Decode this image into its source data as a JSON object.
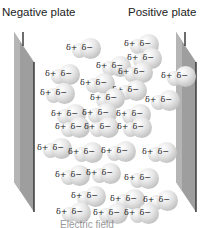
{
  "labels": {
    "negative_plate": "Negative plate",
    "positive_plate": "Positive plate",
    "caption_fragment": "Electric field"
  },
  "molecule_label": {
    "positive": "δ+",
    "negative": "δ−"
  },
  "molecules": [
    {
      "x": 66,
      "y": 38
    },
    {
      "x": 124,
      "y": 34
    },
    {
      "x": 127,
      "y": 48
    },
    {
      "x": 96,
      "y": 56
    },
    {
      "x": 45,
      "y": 64
    },
    {
      "x": 118,
      "y": 62
    },
    {
      "x": 161,
      "y": 66
    },
    {
      "x": 80,
      "y": 73
    },
    {
      "x": 112,
      "y": 80
    },
    {
      "x": 40,
      "y": 83
    },
    {
      "x": 90,
      "y": 88
    },
    {
      "x": 145,
      "y": 90
    },
    {
      "x": 51,
      "y": 104
    },
    {
      "x": 82,
      "y": 103
    },
    {
      "x": 116,
      "y": 104
    },
    {
      "x": 55,
      "y": 117
    },
    {
      "x": 84,
      "y": 117
    },
    {
      "x": 117,
      "y": 117
    },
    {
      "x": 37,
      "y": 138
    },
    {
      "x": 68,
      "y": 142
    },
    {
      "x": 101,
      "y": 141
    },
    {
      "x": 142,
      "y": 142
    },
    {
      "x": 55,
      "y": 165
    },
    {
      "x": 86,
      "y": 163
    },
    {
      "x": 124,
      "y": 168
    },
    {
      "x": 71,
      "y": 186
    },
    {
      "x": 110,
      "y": 189
    },
    {
      "x": 143,
      "y": 190
    },
    {
      "x": 56,
      "y": 202
    },
    {
      "x": 93,
      "y": 203
    },
    {
      "x": 124,
      "y": 203
    }
  ]
}
